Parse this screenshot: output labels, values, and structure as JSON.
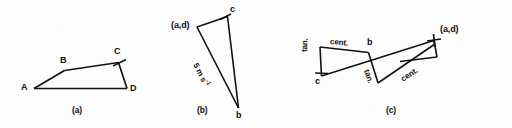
{
  "figure": {
    "background_color": "#fdfdfd",
    "ink_color": "#111111",
    "panels": [
      {
        "caption": "(a)",
        "vertex_labels": [
          "A",
          "B",
          "C",
          "D"
        ]
      },
      {
        "caption": "(b)",
        "vertex_labels": [
          "(a,d)",
          "c",
          "b"
        ],
        "annotation": "5 m s"
      },
      {
        "caption": "(c)",
        "vertex_labels": [
          "c",
          "b",
          "(a,d)"
        ],
        "component_labels": [
          "cent.",
          "tan.",
          "cent.",
          "tan."
        ]
      }
    ]
  },
  "panel_a": {
    "caption": "(a)",
    "label_A": "A",
    "label_B": "B",
    "label_C": "C",
    "label_D": "D"
  },
  "panel_b": {
    "caption": "(b)",
    "label_ad": "(a,d)",
    "label_c": "c",
    "label_b": "b",
    "speed_value": "5 m s",
    "speed_exponent": "-1"
  },
  "panel_c": {
    "caption": "(c)",
    "label_c": "c",
    "label_b": "b",
    "label_ad": "(a,d)",
    "cent_left": "cent.",
    "cent_right": "cent.",
    "tan_left": "tan.",
    "tan_mid": "tan."
  }
}
